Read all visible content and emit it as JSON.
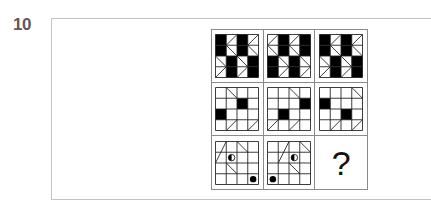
{
  "question": {
    "number": "10"
  },
  "matrix": {
    "rows": 3,
    "cols": 3,
    "grid_size": 4,
    "line_color": "#222222",
    "fill_color": "#000000",
    "cells": [
      {
        "id": "r1c1",
        "black": [
          [
            0,
            0
          ],
          [
            1,
            0
          ],
          [
            0,
            2
          ],
          [
            1,
            2
          ],
          [
            2,
            1
          ],
          [
            3,
            1
          ],
          [
            2,
            3
          ],
          [
            3,
            3
          ]
        ],
        "arrows": [
          {
            "col": 1,
            "dir": "left",
            "rows": [
              0,
              1
            ]
          },
          {
            "col": 3,
            "dir": "left",
            "rows": [
              0,
              1
            ]
          },
          {
            "col": 0,
            "dir": "right",
            "rows": [
              2,
              3
            ]
          },
          {
            "col": 2,
            "dir": "right",
            "rows": [
              2,
              3
            ]
          }
        ]
      },
      {
        "id": "r1c2",
        "black": [
          [
            0,
            1
          ],
          [
            1,
            1
          ],
          [
            0,
            3
          ],
          [
            1,
            3
          ],
          [
            2,
            0
          ],
          [
            3,
            0
          ],
          [
            2,
            2
          ],
          [
            3,
            2
          ]
        ],
        "arrows": [
          {
            "col": 0,
            "dir": "left",
            "rows": [
              0,
              1
            ]
          },
          {
            "col": 2,
            "dir": "left",
            "rows": [
              0,
              1
            ]
          },
          {
            "col": 1,
            "dir": "right",
            "rows": [
              2,
              3
            ]
          },
          {
            "col": 3,
            "dir": "right",
            "rows": [
              2,
              3
            ]
          }
        ]
      },
      {
        "id": "r1c3",
        "black": [
          [
            0,
            0
          ],
          [
            1,
            0
          ],
          [
            0,
            2
          ],
          [
            1,
            2
          ],
          [
            2,
            1
          ],
          [
            3,
            1
          ],
          [
            2,
            3
          ],
          [
            3,
            3
          ]
        ],
        "arrows": [
          {
            "col": 1,
            "dir": "left",
            "rows": [
              0,
              1
            ]
          },
          {
            "col": 3,
            "dir": "left",
            "rows": [
              0,
              1
            ]
          },
          {
            "col": 0,
            "dir": "right",
            "rows": [
              2,
              3
            ]
          },
          {
            "col": 2,
            "dir": "right",
            "rows": [
              2,
              3
            ]
          }
        ]
      },
      {
        "id": "r2c1",
        "black": [
          [
            1,
            2
          ],
          [
            2,
            0
          ]
        ],
        "diagonals": [
          {
            "r": 0,
            "c": 1,
            "type": "back"
          },
          {
            "r": 3,
            "c": 1,
            "type": "fwd"
          },
          {
            "r": 3,
            "c": 3,
            "type": "fwd"
          }
        ]
      },
      {
        "id": "r2c2",
        "black": [
          [
            1,
            3
          ],
          [
            2,
            1
          ]
        ],
        "diagonals": [
          {
            "r": 0,
            "c": 2,
            "type": "back"
          },
          {
            "r": 3,
            "c": 0,
            "type": "fwd"
          },
          {
            "r": 3,
            "c": 2,
            "type": "fwd"
          }
        ]
      },
      {
        "id": "r2c3",
        "black": [
          [
            1,
            0
          ],
          [
            2,
            2
          ]
        ],
        "diagonals": [
          {
            "r": 0,
            "c": 3,
            "type": "back"
          },
          {
            "r": 3,
            "c": 1,
            "type": "fwd"
          },
          {
            "r": 3,
            "c": 3,
            "type": "fwd"
          }
        ]
      },
      {
        "id": "r3c1",
        "black": [],
        "long_lines": [
          {
            "x1": 0,
            "y1": 2,
            "x2": 1,
            "y2": 0
          },
          {
            "x1": 2,
            "y1": 0,
            "x2": 3,
            "y2": 1
          },
          {
            "x1": 1,
            "y1": 2,
            "x2": 2,
            "y2": 3
          }
        ],
        "half_circle": {
          "r": 1,
          "c": 1
        },
        "dot": {
          "r": 3,
          "c": 3
        }
      },
      {
        "id": "r3c2",
        "black": [],
        "long_lines": [
          {
            "x1": 1,
            "y1": 2,
            "x2": 2,
            "y2": 0
          },
          {
            "x1": 3,
            "y1": 0,
            "x2": 4,
            "y2": 1
          },
          {
            "x1": 2,
            "y1": 2,
            "x2": 3,
            "y2": 3
          }
        ],
        "half_circle": {
          "r": 1,
          "c": 2
        },
        "dot": {
          "r": 3,
          "c": 0
        }
      },
      {
        "id": "r3c3",
        "missing": true,
        "label": "?"
      }
    ]
  }
}
